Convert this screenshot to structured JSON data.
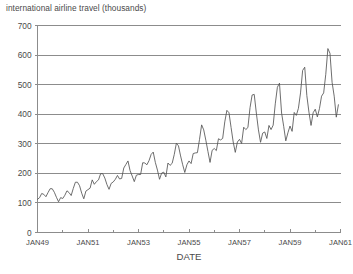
{
  "chart_data": {
    "type": "line",
    "title": "international airline travel (thousands)",
    "xlabel": "DATE",
    "ylabel": "",
    "ylim": [
      0,
      700
    ],
    "ytick_values": [
      0,
      100,
      200,
      300,
      400,
      500,
      600,
      700
    ],
    "ytick_labels": [
      "0",
      "100",
      "200",
      "300",
      "400",
      "500",
      "600",
      "700"
    ],
    "xtick_labels": [
      "JAN49",
      "JAN51",
      "JAN53",
      "JAN55",
      "JAN57",
      "JAN59",
      "JAN61"
    ],
    "xtick_indices": [
      0,
      24,
      48,
      72,
      96,
      120,
      144
    ],
    "minor_xtick_indices": [
      12,
      36,
      60,
      84,
      108,
      132
    ],
    "grid": "horizontal",
    "legend": "none",
    "x_start_label": "JAN49",
    "x_end_label": "JAN61",
    "series": [
      {
        "name": "international airline travel (thousands)",
        "values": [
          112,
          118,
          132,
          129,
          121,
          135,
          148,
          148,
          136,
          119,
          104,
          118,
          115,
          126,
          141,
          135,
          125,
          149,
          170,
          170,
          158,
          133,
          114,
          140,
          145,
          150,
          178,
          163,
          172,
          178,
          199,
          199,
          184,
          162,
          146,
          166,
          171,
          180,
          193,
          181,
          183,
          218,
          230,
          242,
          209,
          191,
          172,
          194,
          196,
          196,
          236,
          235,
          229,
          243,
          264,
          272,
          237,
          211,
          180,
          201,
          204,
          188,
          235,
          227,
          234,
          264,
          302,
          293,
          259,
          229,
          203,
          229,
          242,
          233,
          267,
          269,
          270,
          315,
          364,
          347,
          312,
          274,
          237,
          278,
          284,
          277,
          317,
          313,
          318,
          374,
          413,
          405,
          355,
          306,
          271,
          306,
          315,
          301,
          356,
          348,
          355,
          422,
          465,
          467,
          404,
          347,
          305,
          336,
          340,
          318,
          362,
          348,
          363,
          435,
          491,
          505,
          404,
          359,
          310,
          337,
          360,
          342,
          406,
          396,
          420,
          472,
          548,
          559,
          463,
          407,
          362,
          405,
          417,
          391,
          419,
          461,
          472,
          535,
          622,
          606,
          508,
          461,
          390,
          432
        ]
      }
    ]
  },
  "colors": {
    "gridline": "#8c8c8c",
    "data_line": "#545454",
    "text": "#4a4a4a",
    "background": "#ffffff"
  }
}
